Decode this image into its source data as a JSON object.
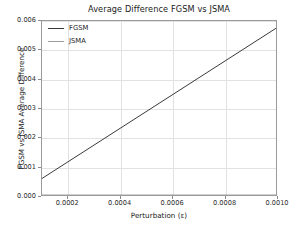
{
  "chart_data": {
    "type": "line",
    "title": "Average Difference FGSM vs JSMA",
    "xlabel": "Perturbation (ε)",
    "ylabel": "FGSM vs JSMA Average Difference",
    "xlim": [
      0.0001,
      0.001
    ],
    "ylim": [
      0.0,
      0.006
    ],
    "grid": true,
    "legend_position": "upper left",
    "xticks": [
      0.0002,
      0.0004,
      0.0006,
      0.0008,
      0.001
    ],
    "xtick_labels": [
      "0.0002",
      "0.0004",
      "0.0006",
      "0.0008",
      "0.0010"
    ],
    "yticks": [
      0.0,
      0.001,
      0.002,
      0.003,
      0.004,
      0.005,
      0.006
    ],
    "ytick_labels": [
      "0.000",
      "0.001",
      "0.002",
      "0.003",
      "0.004",
      "0.005",
      "0.006"
    ],
    "x": [
      0.0001,
      0.0002,
      0.0003,
      0.0004,
      0.0005,
      0.0006,
      0.0007,
      0.0008,
      0.0009,
      0.001
    ],
    "series": [
      {
        "name": "FGSM",
        "color": "#3a3a3a",
        "values": [
          0.00057,
          0.00094,
          0.00131,
          0.00168,
          0.00206,
          0.00243,
          0.0028,
          0.00317,
          0.00354,
          0.00392
        ]
      },
      {
        "name": "JSMA",
        "color": "#9e9e9e",
        "values": [
          0.0,
          0.0,
          0.0,
          0.0,
          0.0,
          0.0,
          0.0,
          0.0,
          0.0,
          0.0
        ]
      }
    ],
    "series_display": [
      {
        "name": "FGSM",
        "color": "#3a3a3a",
        "x_start": 0.0001,
        "y_start": 0.00057,
        "x_end": 0.001,
        "y_end": 0.00575
      },
      {
        "name": "JSMA",
        "color": "#9e9e9e",
        "x_start": 0.0001,
        "y_start": 0.0,
        "x_end": 0.001,
        "y_end": 0.0
      }
    ],
    "legend": [
      {
        "label": "FGSM",
        "color": "#3a3a3a"
      },
      {
        "label": "JSMA",
        "color": "#9e9e9e"
      }
    ],
    "colors": {
      "fgsm": "#3a3a3a",
      "jsma": "#9e9e9e",
      "grid": "#e2e2e2",
      "axis": "#9a9a9a",
      "background": "#ffffff",
      "text": "#1a1a1a"
    }
  }
}
